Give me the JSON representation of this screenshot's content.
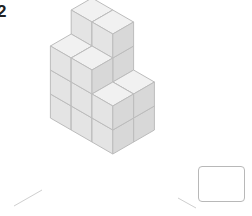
{
  "question": {
    "number": "2"
  },
  "answer": {
    "value": ""
  },
  "colors": {
    "top": "#f1f1f1",
    "left": "#e4e4e4",
    "right": "#d8d8d8",
    "edge": "#bcbcbc",
    "axis": "#cfcfcf"
  },
  "figure": {
    "origin_x": 92,
    "origin_y": 166,
    "cube_edge": 24,
    "columns": [
      {
        "gx": 0,
        "gy": 0,
        "height": 4
      },
      {
        "gx": 1,
        "gy": 0,
        "height": 4
      },
      {
        "gx": 0,
        "gy": 1,
        "height": 3
      },
      {
        "gx": 1,
        "gy": 1,
        "height": 3
      },
      {
        "gx": 2,
        "gy": 1,
        "height": 2
      },
      {
        "gx": 2,
        "gy": 0,
        "height": 2
      }
    ],
    "axes": [
      {
        "x1": 92,
        "y1": 10,
        "x2": 92,
        "y2": 45
      },
      {
        "x1": 42,
        "y1": 190,
        "x2": 14,
        "y2": 206
      },
      {
        "x1": 178,
        "y1": 198,
        "x2": 196,
        "y2": 208
      }
    ]
  }
}
